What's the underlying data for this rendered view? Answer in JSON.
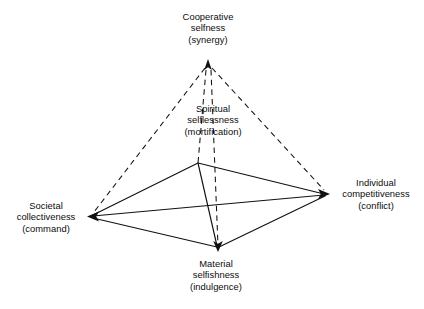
{
  "figure": {
    "type": "tetrahedron-value-diagram",
    "background_color": "#ffffff",
    "line_color": "#111111"
  },
  "nodes": {
    "apex": {
      "id": "cooperative-selfness",
      "line1": "Cooperative",
      "line2": "selfness",
      "line3": "(synergy)",
      "point": {
        "x": 208,
        "y": 62
      },
      "arrow": "up"
    },
    "back": {
      "id": "spiritual-selflessness",
      "line1": "Spiritual",
      "line2": "selflessness",
      "line3": "(mortification)",
      "point": {
        "x": 198,
        "y": 163
      },
      "arrow": "none"
    },
    "left": {
      "id": "societal-collectiveness",
      "line1": "Societal",
      "line2": "collectiveness",
      "line3": "(command)",
      "point": {
        "x": 90,
        "y": 216
      },
      "arrow": "left"
    },
    "right": {
      "id": "individual-competitiveness",
      "line1": "Individual",
      "line2": "competitiveness",
      "line3": "(conflict)",
      "point": {
        "x": 327,
        "y": 194
      },
      "arrow": "right"
    },
    "bottom": {
      "id": "material-selfishness",
      "line1": "Material",
      "line2": "selfishness",
      "line3": "(indulgence)",
      "point": {
        "x": 218,
        "y": 249
      },
      "arrow": "down"
    }
  },
  "edges": {
    "solid": [
      {
        "name": "left-to-back",
        "from": "left",
        "to": "back"
      },
      {
        "name": "back-to-right",
        "from": "back",
        "to": "right"
      },
      {
        "name": "left-to-bottom",
        "from": "left",
        "to": "bottom"
      },
      {
        "name": "bottom-to-right",
        "from": "bottom",
        "to": "right"
      },
      {
        "name": "left-to-right-diagonal",
        "from": "left",
        "to": "right"
      },
      {
        "name": "back-to-bottom",
        "from": "back",
        "to": "bottom"
      }
    ],
    "dashed": [
      {
        "name": "apex-to-left",
        "from": "apex",
        "to": "left"
      },
      {
        "name": "apex-to-right",
        "from": "apex",
        "to": "right"
      },
      {
        "name": "apex-to-back",
        "from": "apex",
        "to": "back"
      },
      {
        "name": "apex-to-bottom",
        "from": "apex",
        "to": "bottom"
      }
    ]
  }
}
